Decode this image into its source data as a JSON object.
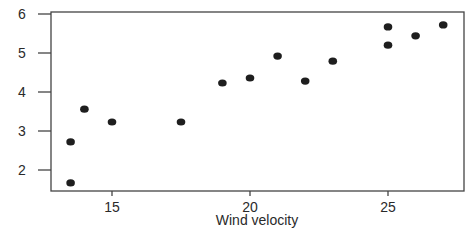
{
  "chart_data": {
    "type": "scatter",
    "title": "",
    "xlabel": "Wind velocity",
    "ylabel": "",
    "xlim": [
      13.1,
      27.5
    ],
    "ylim": [
      1.45,
      6.1
    ],
    "xticks": [
      15,
      20,
      25
    ],
    "yticks": [
      2,
      3,
      4,
      5,
      6
    ],
    "grid": false,
    "legend": null,
    "series": [
      {
        "name": "points",
        "color": "#1e1e1e",
        "points": [
          {
            "x": 13.5,
            "y": 1.67
          },
          {
            "x": 13.5,
            "y": 2.72
          },
          {
            "x": 14.0,
            "y": 3.56
          },
          {
            "x": 15.0,
            "y": 3.23
          },
          {
            "x": 17.5,
            "y": 3.23
          },
          {
            "x": 19.0,
            "y": 4.23
          },
          {
            "x": 20.0,
            "y": 4.36
          },
          {
            "x": 21.0,
            "y": 4.92
          },
          {
            "x": 22.0,
            "y": 4.28
          },
          {
            "x": 23.0,
            "y": 4.79
          },
          {
            "x": 25.0,
            "y": 5.2
          },
          {
            "x": 25.0,
            "y": 5.67
          },
          {
            "x": 26.0,
            "y": 5.44
          },
          {
            "x": 27.0,
            "y": 5.72
          }
        ]
      }
    ]
  },
  "labels": {
    "x_axis_title": "Wind velocity",
    "x_ticks": [
      "15",
      "20",
      "25"
    ],
    "y_ticks": [
      "2",
      "3",
      "4",
      "5",
      "6"
    ]
  }
}
